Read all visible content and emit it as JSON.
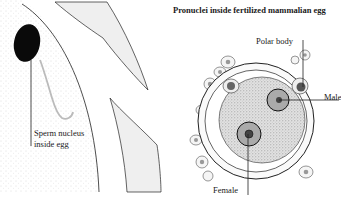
{
  "left_panel": {
    "label_line1": "Sperm nucleus",
    "label_line2": "inside egg"
  },
  "right_panel": {
    "title": "Pronuclei inside fertilized mammalian egg",
    "labels": {
      "polar_body": "Polar body",
      "male": "Male",
      "female": "Female"
    }
  },
  "colors": {
    "line": "#1a1a1a",
    "stipple": "#b8b8b8",
    "fill_light": "#ececec",
    "cytoplasm": "#d4d4d4"
  }
}
